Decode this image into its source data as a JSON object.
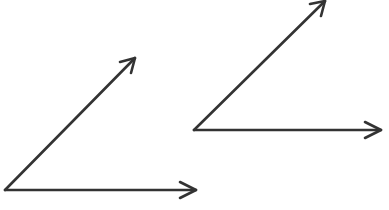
{
  "diagram": {
    "stroke_color": "#333333",
    "background": "#ffffff",
    "angles": [
      {
        "name": "angle-left",
        "vertex": [
          5,
          190
        ],
        "rays": [
          {
            "name": "horizontal",
            "end": [
              197,
              190
            ]
          },
          {
            "name": "diagonal",
            "end": [
              135,
              58
            ]
          }
        ]
      },
      {
        "name": "angle-right",
        "vertex": [
          194,
          130
        ],
        "rays": [
          {
            "name": "horizontal",
            "end": [
              382,
              130
            ]
          },
          {
            "name": "diagonal",
            "end": [
              325,
              1
            ]
          }
        ]
      }
    ]
  }
}
